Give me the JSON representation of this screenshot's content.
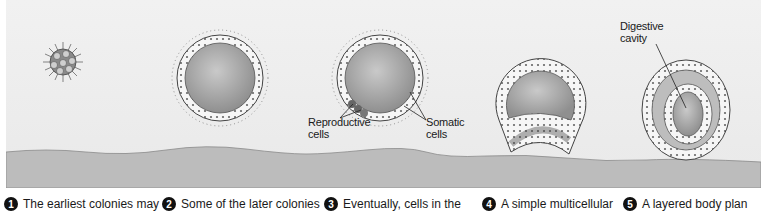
{
  "figure": {
    "labels": {
      "reproductive": [
        "Reproductive",
        "cells"
      ],
      "somatic": [
        "Somatic",
        "cells"
      ],
      "digestive": [
        "Digestive",
        "cavity"
      ]
    },
    "stages": [
      {
        "number": "1",
        "caption": "The earliest colonies may"
      },
      {
        "number": "2",
        "caption": "Some of the later colonies"
      },
      {
        "number": "3",
        "caption": "Eventually, cells in the"
      },
      {
        "number": "4",
        "caption": "A simple multicellular"
      },
      {
        "number": "5",
        "caption": "A layered body plan"
      }
    ],
    "colors": {
      "background": "#eeeeee",
      "ground": "#bdbdbd",
      "cell_outline": "#555555",
      "interior": "#a9a9a9"
    }
  }
}
